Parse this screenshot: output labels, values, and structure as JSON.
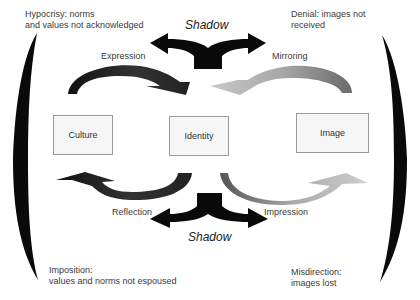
{
  "diagram": {
    "corners": {
      "top_left": [
        "Hypocrisy: norms",
        "and values not acknowledged"
      ],
      "top_right": [
        "Denial: images not",
        "received"
      ],
      "bottom_left": [
        "Imposition:",
        "values and norms not espoused"
      ],
      "bottom_right": [
        "Misdirection:",
        "images lost"
      ]
    },
    "shadow_top": "Shadow",
    "shadow_bottom": "Shadow",
    "boxes": {
      "culture": "Culture",
      "identity": "Identity",
      "image": "Image"
    },
    "arrows": {
      "expression": "Expression",
      "mirroring": "Mirroring",
      "reflection": "Reflection",
      "impression": "Impression"
    },
    "colors": {
      "dark_arrow": "#111111",
      "light_arrow": "#b5b5b5",
      "box_fill": "#f6f6f6",
      "box_border": "#9a9a9a"
    }
  }
}
